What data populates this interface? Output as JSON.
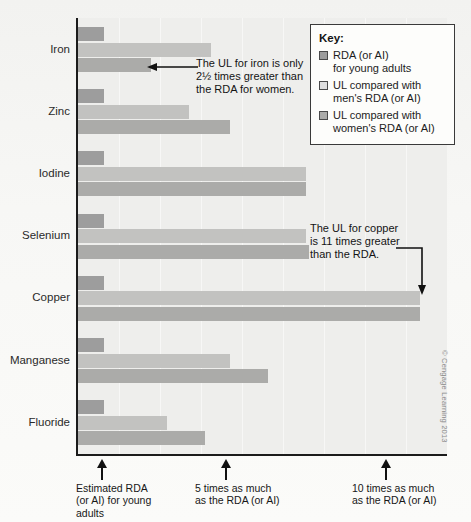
{
  "chart_data": {
    "type": "bar",
    "orientation": "horizontal",
    "title": "",
    "xlabel": "",
    "ylabel": "",
    "xlim": [
      0,
      11.7
    ],
    "grid": false,
    "legend_position": "top-right",
    "categories": [
      "Iron",
      "Zinc",
      "Iodine",
      "Selenium",
      "Copper",
      "Manganese",
      "Fluoride"
    ],
    "series": [
      {
        "name": "RDA (or AI) for young adults",
        "color": "#9d9d9d",
        "values": [
          1,
          1,
          1,
          1,
          1,
          1,
          1
        ]
      },
      {
        "name": "UL compared with men's RDA (or AI)",
        "color": "#c2c2c0",
        "values": [
          4.4,
          3.7,
          7.4,
          7.4,
          11,
          5.0,
          3.0
        ]
      },
      {
        "name": "UL compared with women's RDA (or AI)",
        "color": "#ababa9",
        "values": [
          2.5,
          5.0,
          7.4,
          7.5,
          11,
          6.2,
          4.2
        ]
      }
    ],
    "x_tick_values": [
      1,
      5,
      10
    ],
    "x_tick_labels": [
      "Estimated RDA (or AI) for young adults",
      "5 times as much as the RDA (or AI)",
      "10 times as much as the RDA (or AI)"
    ],
    "annotations": [
      {
        "text": "The UL for iron is only 2½ times greater than the RDA for women.",
        "points_to": "Iron UL compared with women's RDA",
        "value": 2.5
      },
      {
        "text": "The UL for copper is 11 times greater than the RDA.",
        "points_to": "Copper UL",
        "value": 11
      }
    ]
  },
  "key": {
    "title": "Key:",
    "items": [
      {
        "label_line1": "RDA (or AI)",
        "label_line2": "for young adults",
        "color": "#9d9d9d"
      },
      {
        "label_line1": "UL compared with",
        "label_line2": "men's RDA (or AI)",
        "color": "#dedede"
      },
      {
        "label_line1": "UL compared with",
        "label_line2": "women's RDA (or AI)",
        "color": "#ababa9"
      }
    ]
  },
  "annotations": {
    "iron": {
      "line1": "The UL for iron is only",
      "line2": "2½ times greater than",
      "line3": "the RDA for women."
    },
    "copper": {
      "line1": "The UL for copper",
      "line2": "is 11 times greater",
      "line3": "than the RDA."
    }
  },
  "x_axis": {
    "caption1": {
      "line1": "Estimated RDA",
      "line2": "(or AI) for young",
      "line3": "adults"
    },
    "caption2": {
      "line1": "5 times as much",
      "line2": "as the RDA (or AI)",
      "line3": ""
    },
    "caption3": {
      "line1": "10 times as much",
      "line2": "as the RDA (or AI)",
      "line3": ""
    }
  },
  "y_labels": [
    "Iron",
    "Zinc",
    "Iodine",
    "Selenium",
    "Copper",
    "Manganese",
    "Fluoride"
  ],
  "credit": "© Cengage Learning 2013"
}
